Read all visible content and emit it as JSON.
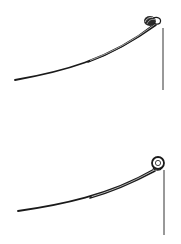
{
  "diagram": {
    "background": "#ffffff",
    "stroke_color": "#1a1a1a",
    "figures": [
      {
        "id": "upturned-eye-spring",
        "description": "leaf spring with up-turned eye",
        "main_leaf": "M15,80 C60,72 110,60 155,24",
        "second_leaf": "M88,62 C115,52 135,40 157,23",
        "eye": {
          "cx": 151,
          "cy": 21,
          "rx": 6,
          "ry": 5
        },
        "shackle_line": {
          "x": 163,
          "y1": 28,
          "y2": 90
        }
      },
      {
        "id": "rolled-eye-spring",
        "description": "leaf spring with rolled (Berlin) eye",
        "main_leaf": "M18,211 C60,205 110,195 154,170",
        "second_leaf": "M90,198 C118,190 138,180 156,172",
        "eye": {
          "cx": 158,
          "cy": 163,
          "r": 6
        },
        "shackle_line": {
          "x": 164,
          "y1": 170,
          "y2": 235
        }
      }
    ]
  }
}
